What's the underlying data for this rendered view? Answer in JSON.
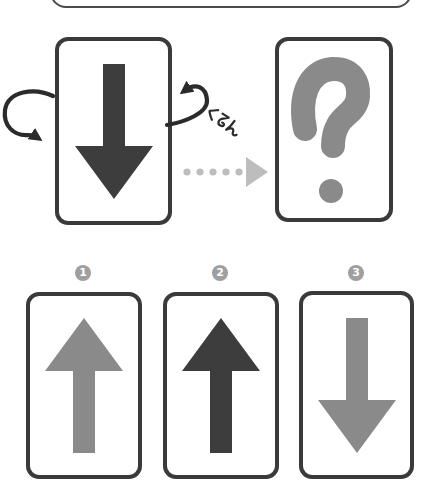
{
  "background": "#ffffff",
  "colors": {
    "card_border": "#3a3a3a",
    "top_box_border": "#4a4a4a",
    "dark": "#3d3d3d",
    "gray": "#8a8a8a",
    "dotted": "#bdbdbd",
    "badge_bg": "#9f9f9f",
    "badge_text": "#ffffff",
    "rotation": "#2b2b2b"
  },
  "puzzle": {
    "source_card": {
      "symbol": "down-arrow",
      "color": "#3d3d3d"
    },
    "rotation_label": "くるん",
    "transform_arrow": "dotted-right-arrow",
    "result_card": {
      "symbol": "question-mark",
      "glyph": "?",
      "color": "#8a8a8a"
    }
  },
  "options": [
    {
      "number": "1",
      "symbol": "up-arrow",
      "color": "#8a8a8a"
    },
    {
      "number": "2",
      "symbol": "up-arrow",
      "color": "#3d3d3d"
    },
    {
      "number": "3",
      "symbol": "down-arrow",
      "color": "#8a8a8a"
    }
  ]
}
